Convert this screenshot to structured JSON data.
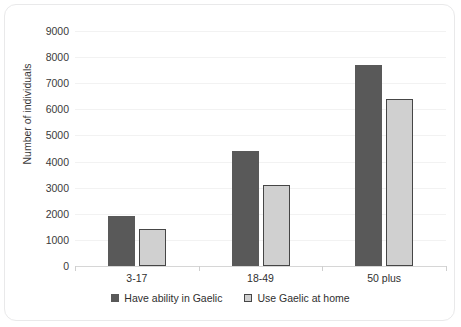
{
  "chart_data": {
    "type": "bar",
    "title": "",
    "subtitle": "",
    "xlabel": "",
    "ylabel": "Number of individuals",
    "categories": [
      "3-17",
      "18-49",
      "50 plus"
    ],
    "series": [
      {
        "name": "Have ability in Gaelic",
        "color": "#595959",
        "values": [
          1900,
          4400,
          7700
        ]
      },
      {
        "name": "Use Gaelic at home",
        "color": "#d0d0d0",
        "values": [
          1400,
          3100,
          6400
        ]
      }
    ],
    "ylim": [
      0,
      9000
    ],
    "ytick_step": 1000,
    "ytick_labels": [
      "9000",
      "8000",
      "7000",
      "6000",
      "5000",
      "4000",
      "3000",
      "2000",
      "1000",
      "0"
    ],
    "grid": true,
    "grid_color": "#f2f2f2",
    "legend_position": "bottom",
    "frame_border_color": "#e9e9ea",
    "background_color": "#ffffff"
  }
}
